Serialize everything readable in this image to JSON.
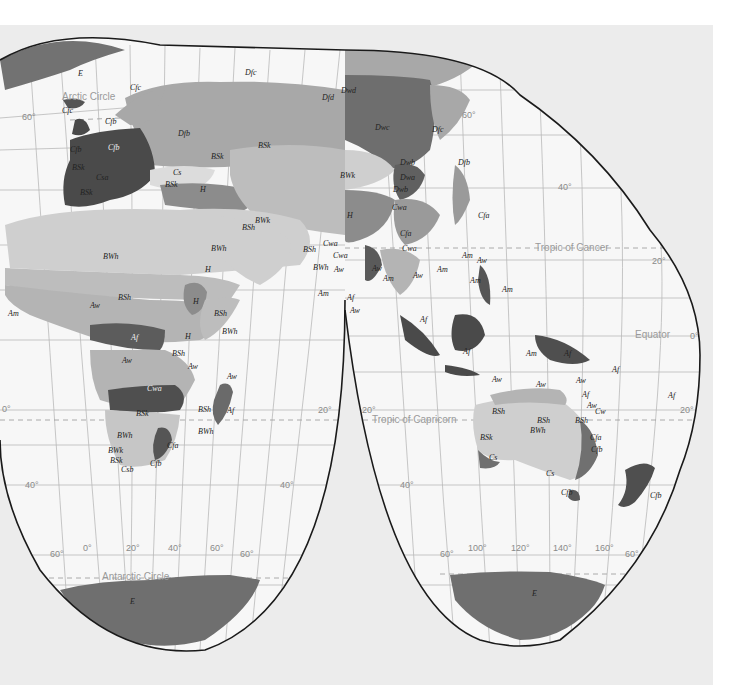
{
  "map": {
    "title": "World climate regions (Köppen classification)",
    "projection": "interrupted homolosine",
    "colors": {
      "page_bg": "#ffffff",
      "canvas_bg": "#ececec",
      "ocean": "#f7f7f7",
      "graticule": "#b9b9b9",
      "outline": "#1a1a1a",
      "tropical_wet_Af": "#5c5c5c",
      "tropical_Aw_Am": "#b4b4b4",
      "desert_BWh": "#cfcfcf",
      "steppe_BSh": "#bdbdbd",
      "subtropical_Csa_Cfb": "#4a4a4a",
      "humid_Cfa": "#9a9a9a",
      "continental_Dfb_Dfc": "#a8a8a8",
      "continental_Dwc_Dwd": "#6e6e6e",
      "highland_H": "#8c8c8c",
      "polar_E": "#727272"
    },
    "reference_lines": {
      "arctic_circle": "Arctic Circle",
      "tropic_cancer": "Tropic of Cancer",
      "equator": "Equator",
      "tropic_capricorn": "Tropic of Capricorn",
      "antarctic_circle": "Antarctic Circle"
    },
    "latitude_labels": {
      "lat60n_left": "60°",
      "lat60n_right": "60°",
      "lat40n_right": "40°",
      "lat20n_right": "20°",
      "lat0_left": "0°",
      "lat0_right": "0°",
      "lat20s_left": "20°",
      "lat20s_mid": "20°",
      "lat20s_mid2": "20°",
      "lat20s_right": "20°",
      "lat40s_left": "40°",
      "lat40s_mid": "40°",
      "lat40s_mid2": "40°",
      "lat40s_right": "40°",
      "lat60s_left": "60°",
      "lat60s_mid": "60°",
      "lat60s_mid2": "60°",
      "lat60s_right": "60°"
    },
    "longitude_labels": {
      "lon0": "0°",
      "lon20": "20°",
      "lon40": "40°",
      "lon60": "60°",
      "lon100": "100°",
      "lon120": "120°",
      "lon140": "140°",
      "lon160": "160°"
    },
    "climate_labels": {
      "E_greenland": "E",
      "E_ant_w": "E",
      "E_ant_e": "E",
      "Cfc_iceland": "Cfc",
      "Cfc_norway": "Cfc",
      "Cfb_scan": "Cfb",
      "Cfb_uk": "Cfb",
      "Cfb_eu": "Cfb",
      "Csa_med": "Csa",
      "BSk_iberia": "BSk",
      "BSk_n_africa": "BSk",
      "Dfb_eu": "Dfb",
      "Dfc_russia": "Dfc",
      "Dfd": "Dfd",
      "Dwd": "Dwd",
      "Dwc": "Dwc",
      "Dfc_east": "Dfc",
      "Dwb_1": "Dwb",
      "Dwb_2": "Dwb",
      "Dwa": "Dwa",
      "Dfa": "Dfa",
      "Dfb_japan": "Dfb",
      "Cwa_china": "Cwa",
      "Cfa_china": "Cfa",
      "Cfa_japan": "Cfa",
      "BSk_asia": "BSk",
      "BWk_asia": "BWk",
      "BSk_caspian": "BSk",
      "BWk_iran": "BWk",
      "BSh_iran": "BSh",
      "BSk_turkey": "BSk",
      "H_caucasus": "H",
      "H_tibet": "H",
      "Cs_turkey": "Cs",
      "BWh_sahara": "BWh",
      "BWh_arabia": "BWh",
      "H_yemen": "H",
      "BSh_sahel": "BSh",
      "Aw_w_africa": "Aw",
      "Am_w_africa": "Am",
      "H_ethiopia": "H",
      "BSh_horn": "BSh",
      "BWh_somalia": "BWh",
      "Af_congo": "Af",
      "H_e_africa": "H",
      "BSh_e_africa": "BSh",
      "Aw_s_africa": "Aw",
      "Aw_e_africa": "Aw",
      "Cwa_s_africa": "Cwa",
      "BSk_s_africa": "BSk",
      "BWh_namibia": "BWh",
      "BWk_s_africa": "BWk",
      "BSk_cape": "BSk",
      "Csb_cape": "Csb",
      "Cfa_s_africa": "Cfa",
      "Cfb_s_africa": "Cfb",
      "Aw_madagascar": "Aw",
      "BSh_madagascar": "BSh",
      "BWh_madagascar": "BWh",
      "Af_madagascar": "Af",
      "Cwa_india": "Cwa",
      "Cwa_india2": "Cwa",
      "BSh_india": "BSh",
      "BWh_india": "BWh",
      "Aw_india": "Aw",
      "Am_india": "Am",
      "Af_srilanka": "Af",
      "Aw_srilanka": "Aw",
      "Aw_burma": "Aw",
      "Am_burma": "Am",
      "Cwa_se_asia": "Cwa",
      "Aw_indochina": "Aw",
      "Am_indochina": "Am",
      "Am_phil1": "Am",
      "Aw_phil": "Aw",
      "Am_phil2": "Am",
      "Am_phil3": "Am",
      "Af_sumatra": "Af",
      "Af_borneo": "Af",
      "Aw_timor": "Aw",
      "Am_newguinea": "Am",
      "Af_newguinea": "Af",
      "Af_pacific": "Af",
      "Af_pacific2": "Af",
      "Aw_n_aus": "Aw",
      "Aw_cape_york": "Aw",
      "Af_queensland": "Af",
      "Aw_queensland": "Aw",
      "Cw_queensland": "Cw",
      "BSh_nw_aus": "BSh",
      "BSh_c_aus": "BSh",
      "BWh_aus": "BWh",
      "BSh_e_aus": "BSh",
      "BSk_w_aus": "BSk",
      "Cs_w_aus": "Cs",
      "Cs_s_aus": "Cs",
      "Cfa_e_aus": "Cfa",
      "Cfb_e_aus": "Cfb",
      "Cfb_tasmania": "Cfb",
      "Cfb_nz": "Cfb",
      "Aw_kuwait": "Aw",
      "Am_arabia": "Am"
    }
  }
}
